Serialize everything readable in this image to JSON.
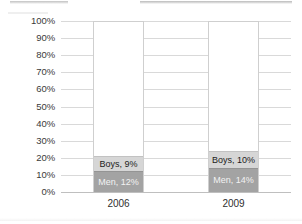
{
  "chart_data": {
    "type": "bar",
    "subtype": "100% stacked column",
    "title": "",
    "xlabel": "",
    "ylabel": "",
    "categories": [
      "2006",
      "2009"
    ],
    "ylim": [
      0,
      100
    ],
    "ytick_labels": [
      "100%",
      "90%",
      "80%",
      "70%",
      "60%",
      "50%",
      "40%",
      "30%",
      "20%",
      "10%",
      "0%"
    ],
    "ytick_values": [
      100,
      90,
      80,
      70,
      60,
      50,
      40,
      30,
      20,
      10,
      0
    ],
    "grid": true,
    "legend": "none",
    "series": [
      {
        "name": "Men",
        "values": [
          12,
          14
        ],
        "color": "#a3a3a3",
        "text_color": "#f2f2f2",
        "data_labels": [
          "Men, 12%",
          "Men, 14%"
        ]
      },
      {
        "name": "Boys",
        "values": [
          9,
          10
        ],
        "color": "#d6d6d6",
        "text_color": "#1c1c1c",
        "data_labels": [
          "Boys, 9%",
          "Boys, 10%"
        ]
      },
      {
        "name": "Remainder",
        "values": [
          79,
          76
        ],
        "color": "#ffffff",
        "text_color": "",
        "data_labels": [
          "",
          ""
        ]
      }
    ],
    "columns": [
      {
        "category": "2006",
        "segments": [
          {
            "name": "Men",
            "value": 12,
            "label": "Men, 12%"
          },
          {
            "name": "Boys",
            "value": 9,
            "label": "Boys, 9%"
          },
          {
            "name": "Remainder",
            "value": 79,
            "label": ""
          }
        ]
      },
      {
        "category": "2009",
        "segments": [
          {
            "name": "Men",
            "value": 14,
            "label": "Men, 14%"
          },
          {
            "name": "Boys",
            "value": 10,
            "label": "Boys, 10%"
          },
          {
            "name": "Remainder",
            "value": 76,
            "label": ""
          }
        ]
      }
    ]
  },
  "axis": {
    "y_ticks": [
      {
        "label": "100%",
        "value": 100
      },
      {
        "label": "90%",
        "value": 90
      },
      {
        "label": "80%",
        "value": 80
      },
      {
        "label": "70%",
        "value": 70
      },
      {
        "label": "60%",
        "value": 60
      },
      {
        "label": "50%",
        "value": 50
      },
      {
        "label": "40%",
        "value": 40
      },
      {
        "label": "30%",
        "value": 30
      },
      {
        "label": "20%",
        "value": 20
      },
      {
        "label": "10%",
        "value": 10
      },
      {
        "label": "0%",
        "value": 0
      }
    ],
    "x_ticks": [
      {
        "label": "2006"
      },
      {
        "label": "2009"
      }
    ]
  },
  "colors": {
    "gridline": "#d9d9d9",
    "baseline": "#bfbfbf",
    "bar_outline": "#cfcfcf",
    "segment_boys": "#d6d6d6",
    "segment_men": "#a3a3a3",
    "plot_background": "#ffffff",
    "tick_text": "#3a3a3a"
  }
}
